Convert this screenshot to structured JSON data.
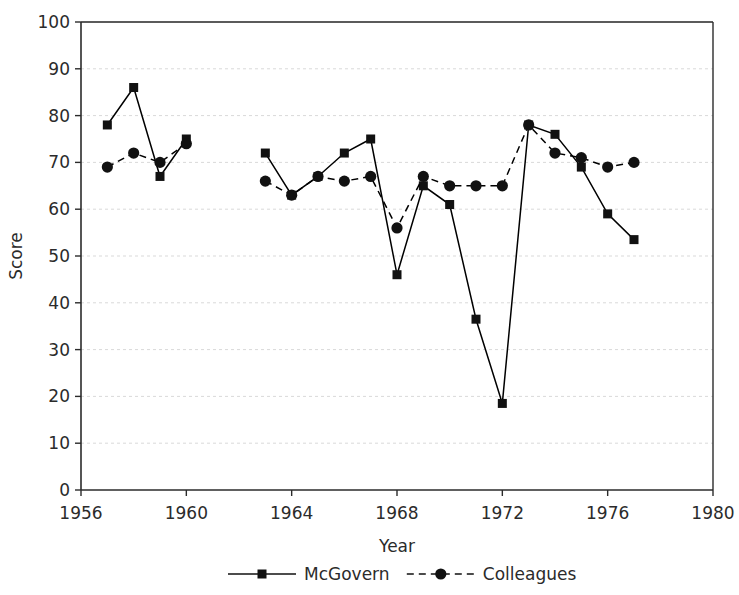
{
  "chart_data": {
    "type": "line",
    "title": "",
    "xlabel": "Year",
    "ylabel": "Score",
    "xlim": [
      1956,
      1980
    ],
    "ylim": [
      0,
      100
    ],
    "xticks": [
      1956,
      1960,
      1964,
      1968,
      1972,
      1976,
      1980
    ],
    "yticks": [
      0,
      10,
      20,
      30,
      40,
      50,
      60,
      70,
      80,
      90,
      100
    ],
    "grid": "horizontal",
    "legend_position": "bottom",
    "series": [
      {
        "name": "McGovern",
        "marker": "square",
        "linestyle": "solid",
        "color": "#000000",
        "segments": [
          {
            "x": [
              1957,
              1958,
              1959,
              1960
            ],
            "values": [
              78,
              86,
              67,
              75
            ]
          },
          {
            "x": [
              1963,
              1964,
              1965,
              1966,
              1967,
              1968,
              1969,
              1970,
              1971,
              1972,
              1973,
              1974,
              1975,
              1976,
              1977
            ],
            "values": [
              72,
              63,
              67,
              72,
              75,
              46,
              65,
              61,
              36.5,
              18.5,
              78,
              76,
              69,
              59,
              53.5
            ]
          }
        ]
      },
      {
        "name": "Colleagues",
        "marker": "diamond",
        "linestyle": "dashed",
        "color": "#000000",
        "segments": [
          {
            "x": [
              1957,
              1958,
              1959,
              1960
            ],
            "values": [
              69,
              72,
              70,
              74
            ]
          },
          {
            "x": [
              1963,
              1964,
              1965,
              1966,
              1967,
              1968,
              1969,
              1970,
              1971,
              1972,
              1973,
              1974,
              1975,
              1976,
              1977
            ],
            "values": [
              66,
              63,
              67,
              66,
              67,
              56,
              67,
              65,
              65,
              65,
              78,
              72,
              71,
              69,
              70
            ]
          }
        ]
      }
    ]
  },
  "legend": {
    "items": [
      {
        "label": "McGovern",
        "marker": "square",
        "linestyle": "solid"
      },
      {
        "label": "Colleagues",
        "marker": "diamond",
        "linestyle": "dashed"
      }
    ]
  },
  "axes": {
    "y_title": "Score",
    "x_title": "Year"
  }
}
